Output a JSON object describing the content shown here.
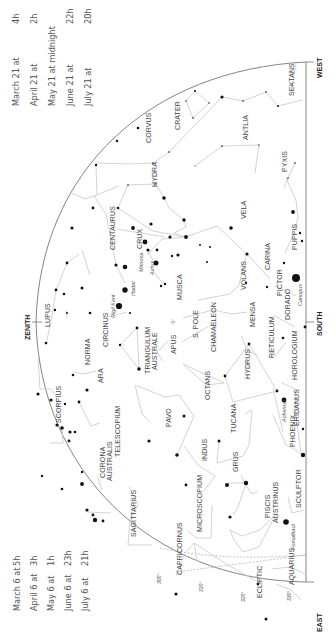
{
  "directions": {
    "zenith": "ZENITH",
    "south": "SOUTH",
    "west": "WEST",
    "east": "EAST",
    "south_pole": "S. POLE",
    "ecliptic": "ECLIPTIC"
  },
  "times_top": [
    {
      "date": "March 21 at",
      "time": "4h"
    },
    {
      "date": "April 21 at",
      "time": "2h"
    },
    {
      "date": "May 21 at midnight",
      "time": ""
    },
    {
      "date": "June 21 at",
      "time": "22h"
    },
    {
      "date": "July 21 at",
      "time": "20h"
    }
  ],
  "times_bottom": [
    {
      "date": "March 6 at",
      "time": "5h"
    },
    {
      "date": "April 6 at",
      "time": "3h"
    },
    {
      "date": "May 6 at",
      "time": "1h"
    },
    {
      "date": "June 6 at",
      "time": "23h"
    },
    {
      "date": "July 6 at",
      "time": "21h"
    }
  ],
  "ecliptic_degrees": [
    "300°",
    "310°",
    "320°",
    "330°"
  ],
  "constellations": {
    "sextans": "SEXTANS",
    "crater": "CRATER",
    "corvus": "CORVUS",
    "antlia": "ANTLIA",
    "hydra": "HYDRA",
    "pyxis": "PYXIS",
    "vela": "VELA",
    "puppis": "PUPPIS",
    "centaurus": "CENTAURUS",
    "crux": "CRUX",
    "carina": "CARINA",
    "volans": "VOLANS",
    "pictor": "PICTOR",
    "musca": "MUSCA",
    "lupus": "LUPUS",
    "circinus": "CIRCINUS",
    "norma": "NORMA",
    "triangulum_australe_1": "TRIANGULUM",
    "triangulum_australe_2": "AUSTRALE",
    "apus": "APUS",
    "chameleon": "CHAMAELEON",
    "mensa": "MENSA",
    "dorado": "DORADO",
    "reticulum": "RETICULUM",
    "hydrus": "HYDRUS",
    "horologium": "HOROLOGIUM",
    "ara": "ARA",
    "scorpius": "SCORPIUS",
    "octans": "OCTANS",
    "eridanus": "ERIDANUS",
    "corona_australis_1": "CORONA",
    "corona_australis_2": "AUSTRALIS",
    "telescopium": "TELESCOPIUM",
    "pavo": "PAVO",
    "indus": "INDUS",
    "tucana": "TUCANA",
    "phoenix": "PHOENIX",
    "grus": "GRUS",
    "sagittarius": "SAGITTARIUS",
    "microscopium": "MICROSCOPIUM",
    "piscis_austrinus_1": "PISCIS",
    "piscis_austrinus_2": "AUSTRINUS",
    "sculptor": "SCULPTOR",
    "capricornus": "CAPRICORNUS",
    "aquarius": "AQUARIUS"
  },
  "stars": {
    "hadar": "Hadar",
    "rigil_kent": "Rigil Kent",
    "mimosa": "Mimosa",
    "acrux": "Acrux",
    "canopus": "Canopus",
    "achernar": "Achernar",
    "fomalhaut": "Fomalhaut"
  }
}
